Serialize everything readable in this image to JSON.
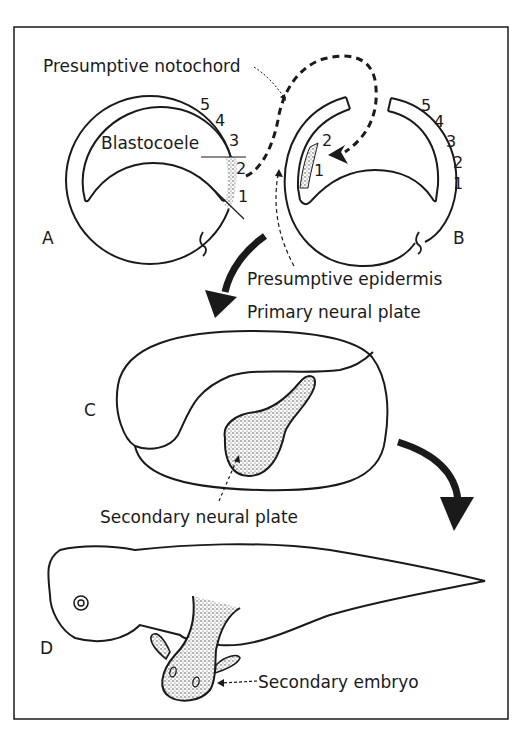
{
  "figure": {
    "panels": [
      {
        "id": "A",
        "label": "A",
        "description": "Early gastrula with presumptive dorsal lip region shaded"
      },
      {
        "id": "B",
        "label": "B",
        "description": "Host gastrula receiving transplanted graft"
      },
      {
        "id": "C",
        "label": "C",
        "description": "Neurula with secondary neural plate"
      },
      {
        "id": "D",
        "label": "D",
        "description": "Larva with secondary embryo"
      }
    ],
    "labels": {
      "presumptive_notochord": "Presumptive notochord",
      "blastocoele": "Blastocoele",
      "presumptive_epidermis": "Presumptive epidermis",
      "primary_neural_plate": "Primary neural plate",
      "secondary_neural_plate": "Secondary neural plate",
      "secondary_embryo": "Secondary embryo"
    },
    "markers_A": [
      "5",
      "4",
      "3",
      "2",
      "1"
    ],
    "markers_B_right": [
      "5",
      "4",
      "3",
      "2",
      "1"
    ],
    "markers_B_graft": [
      "2",
      "1"
    ],
    "colors": {
      "ink": "#1a1a1a",
      "paper": "#ffffff",
      "stipple": "#9a9a9a"
    }
  }
}
